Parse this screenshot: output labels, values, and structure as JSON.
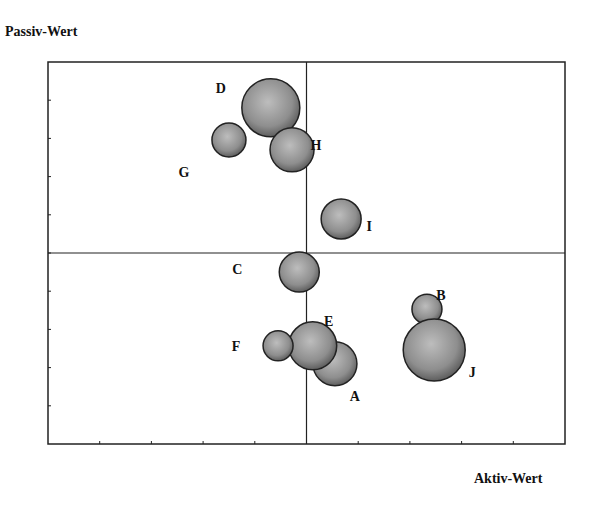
{
  "chart_data": {
    "type": "scatter",
    "subtype": "bubble",
    "title": "",
    "xlabel": "Aktiv-Wert",
    "ylabel": "Passiv-Wert",
    "xlim": [
      0,
      10
    ],
    "ylim": [
      0,
      10
    ],
    "x_ticks": 10,
    "y_ticks": 10,
    "tick_labels_shown": false,
    "quadrant_lines": {
      "x": 5,
      "y": 5
    },
    "grid": false,
    "legend": null,
    "points": [
      {
        "label": "A",
        "x": 5.55,
        "y": 2.1,
        "size": 22
      },
      {
        "label": "B",
        "x": 7.33,
        "y": 3.53,
        "size": 15
      },
      {
        "label": "C",
        "x": 4.86,
        "y": 4.5,
        "size": 20
      },
      {
        "label": "D",
        "x": 4.31,
        "y": 8.8,
        "size": 29
      },
      {
        "label": "E",
        "x": 5.12,
        "y": 2.57,
        "size": 24
      },
      {
        "label": "F",
        "x": 4.45,
        "y": 2.57,
        "size": 15
      },
      {
        "label": "G",
        "x": 3.5,
        "y": 7.96,
        "size": 17
      },
      {
        "label": "H",
        "x": 4.72,
        "y": 7.7,
        "size": 22
      },
      {
        "label": "I",
        "x": 5.67,
        "y": 5.89,
        "size": 20
      },
      {
        "label": "J",
        "x": 7.47,
        "y": 2.46,
        "size": 31
      }
    ],
    "label_offsets": {
      "A": [
        20,
        32
      ],
      "B": [
        14,
        -14
      ],
      "C": [
        -62,
        -3
      ],
      "D": [
        -50,
        -20
      ],
      "E": [
        16,
        -25
      ],
      "F": [
        -42,
        0
      ],
      "G": [
        -45,
        32
      ],
      "H": [
        24,
        -5
      ],
      "I": [
        28,
        7
      ],
      "J": [
        38,
        22
      ]
    }
  },
  "colors": {
    "bubble_light": "#b8b8b8",
    "bubble_dark": "#6a6a6a",
    "stroke": "#222222",
    "axis": "#222222"
  }
}
